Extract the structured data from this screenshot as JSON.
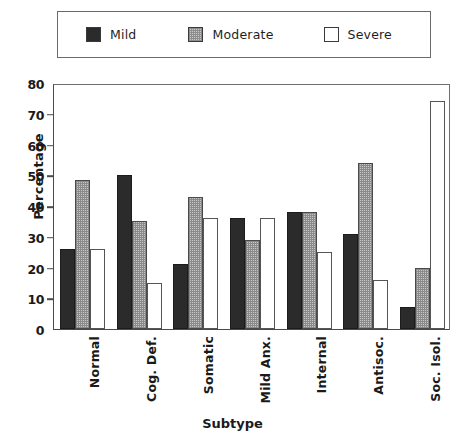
{
  "legend": {
    "items": [
      {
        "label": "Mild",
        "icon": "filled-square-dark",
        "color": "#2b2b2b"
      },
      {
        "label": "Moderate",
        "icon": "hatched-square",
        "color": "#c9c9c9"
      },
      {
        "label": "Severe",
        "icon": "empty-square",
        "color": "#ffffff"
      }
    ]
  },
  "axes": {
    "y_title": "Percentage",
    "x_title": "Subtype",
    "y_ticks": [
      "0",
      "10",
      "20",
      "30",
      "40",
      "50",
      "60",
      "70",
      "80"
    ]
  },
  "chart_data": {
    "type": "bar",
    "title": "",
    "xlabel": "Subtype",
    "ylabel": "Percentage",
    "ylim": [
      0,
      80
    ],
    "ytick_step": 10,
    "grid": false,
    "legend_position": "top",
    "categories": [
      "Normal",
      "Cog. Def.",
      "Somatic",
      "Mild Anx.",
      "Internal",
      "Antisoc.",
      "Soc. Isol."
    ],
    "series": [
      {
        "name": "Mild",
        "values": [
          26,
          50,
          21,
          36,
          38,
          31,
          7
        ]
      },
      {
        "name": "Moderate",
        "values": [
          48.5,
          35,
          43,
          29,
          38,
          54,
          20
        ]
      },
      {
        "name": "Severe",
        "values": [
          26,
          15,
          36,
          36,
          25,
          16,
          74
        ]
      }
    ]
  }
}
